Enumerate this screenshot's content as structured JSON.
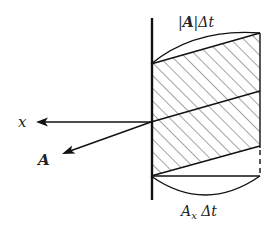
{
  "diagram": {
    "title": "",
    "labels": {
      "x_axis": "x",
      "vector": "A",
      "top_length_bar": "|",
      "top_length_vec": "A",
      "top_length_tail": "|Δt",
      "bottom_length_base": "A",
      "bottom_length_sub": "x",
      "bottom_length_tail": " Δt"
    },
    "elements": [
      {
        "id": "wall",
        "type": "line",
        "description": "thick vertical surface"
      },
      {
        "id": "x-axis-arrow",
        "type": "arrow",
        "direction": "left"
      },
      {
        "id": "vector-A-arrow",
        "type": "arrow",
        "direction": "down-left"
      },
      {
        "id": "hatched-region",
        "type": "parallelogram-stack",
        "hatching": "diagonal"
      },
      {
        "id": "top-arc",
        "type": "arc",
        "measures": "|A|Δt"
      },
      {
        "id": "bottom-arc",
        "type": "arc",
        "measures": "A_x Δt"
      }
    ],
    "colors": {
      "stroke": "#111111",
      "background": "#ffffff"
    }
  }
}
